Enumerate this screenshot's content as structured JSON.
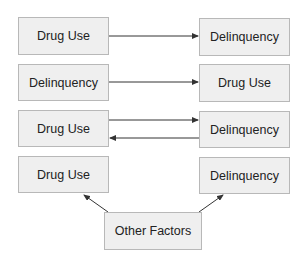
{
  "diagram": {
    "rows": [
      {
        "left": "Drug Use",
        "right": "Delinquency",
        "relation": "left-causes-right"
      },
      {
        "left": "Delinquency",
        "right": "Drug Use",
        "relation": "left-causes-right"
      },
      {
        "left": "Drug Use",
        "right": "Delinquency",
        "relation": "bidirectional"
      },
      {
        "left": "Drug Use",
        "right": "Delinquency",
        "relation": "common-cause"
      }
    ],
    "common_cause": "Other Factors",
    "colors": {
      "box_fill": "#efefef",
      "box_border": "#b8b8b8",
      "arrow": "#333333"
    }
  }
}
